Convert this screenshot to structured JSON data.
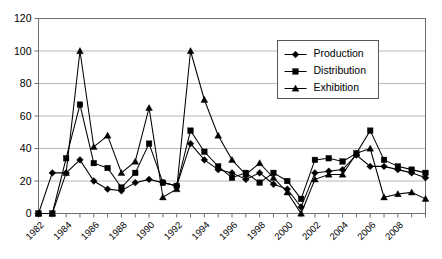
{
  "chart_data": {
    "type": "line",
    "title": "",
    "xlabel": "",
    "ylabel": "",
    "ylim": [
      0,
      120
    ],
    "ytick_step": 20,
    "yticks": [
      0,
      20,
      40,
      60,
      80,
      100,
      120
    ],
    "grid": true,
    "legend_position": "top-right-inside",
    "x_tick_label_rotation": 45,
    "x_tick_label_interval": 2,
    "categories": [
      "1982",
      "1983",
      "1984",
      "1985",
      "1986",
      "1987",
      "1988",
      "1989",
      "1990",
      "1991",
      "1992",
      "1993",
      "1994",
      "1995",
      "1996",
      "1997",
      "1998",
      "1999",
      "2000",
      "2001",
      "2002",
      "2003",
      "2004",
      "2005",
      "2006",
      "2007",
      "2008",
      "2009",
      "2010"
    ],
    "x_visible_tick_labels": [
      "1982",
      "1984",
      "1986",
      "1988",
      "1990",
      "1992",
      "1994",
      "1996",
      "1998",
      "2000",
      "2002",
      "2004",
      "2006",
      "2008"
    ],
    "series": [
      {
        "name": "Production",
        "marker": "diamond",
        "values": [
          0,
          25,
          25,
          33,
          20,
          15,
          14,
          19,
          21,
          19,
          17,
          43,
          33,
          27,
          25,
          21,
          25,
          18,
          15,
          4,
          25,
          26,
          27,
          36,
          29,
          29,
          27,
          25,
          22
        ]
      },
      {
        "name": "Distribution",
        "marker": "square",
        "values": [
          0,
          0,
          34,
          67,
          31,
          28,
          16,
          25,
          43,
          19,
          17,
          51,
          38,
          29,
          22,
          25,
          19,
          25,
          20,
          9,
          33,
          34,
          32,
          37,
          51,
          33,
          29,
          27,
          25
        ]
      },
      {
        "name": "Exhibition",
        "marker": "triangle",
        "values": [
          0,
          0,
          25,
          100,
          41,
          48,
          25,
          32,
          65,
          10,
          15,
          100,
          70,
          48,
          33,
          24,
          31,
          22,
          13,
          0,
          21,
          24,
          24,
          37,
          40,
          10,
          12,
          13,
          9
        ]
      }
    ]
  },
  "legend": {
    "entries": [
      {
        "label": "Production"
      },
      {
        "label": "Distribution"
      },
      {
        "label": "Exhibition"
      }
    ]
  },
  "colors": {
    "line": "#000000",
    "grid": "#a6a6a6",
    "axis": "#6e6e6e",
    "background": "#ffffff"
  }
}
